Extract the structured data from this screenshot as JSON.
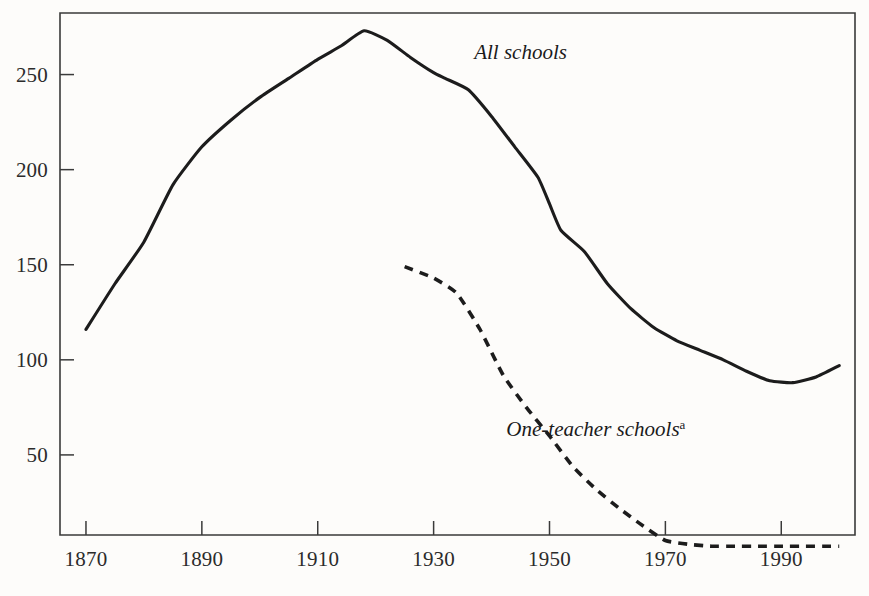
{
  "chart_data": {
    "type": "line",
    "title": "",
    "subtitle": "",
    "xlabel": "",
    "ylabel": "",
    "xlim": [
      1865,
      2001
    ],
    "ylim": [
      0,
      285
    ],
    "grid": false,
    "legend_position": "inline-annotation",
    "y_ticks": [
      50,
      100,
      150,
      200,
      250
    ],
    "y_tick_labels": [
      "50",
      "100",
      "150",
      "200",
      "250"
    ],
    "x_ticks": [
      1870,
      1890,
      1910,
      1930,
      1950,
      1970,
      1990
    ],
    "x_tick_labels": [
      "1870",
      "1890",
      "1910",
      "1930",
      "1950",
      "1970",
      "1990"
    ],
    "annotations": [
      {
        "text": "All schools",
        "footnote": "",
        "x": 1945,
        "y": 258
      },
      {
        "text": "One-teacher schools",
        "footnote": "a",
        "x": 1958,
        "y": 60
      }
    ],
    "series": [
      {
        "name": "All schools",
        "style": "solid",
        "footnote": "",
        "x": [
          1870,
          1875,
          1880,
          1885,
          1890,
          1895,
          1900,
          1905,
          1910,
          1914,
          1918,
          1922,
          1926,
          1930,
          1932,
          1936,
          1940,
          1944,
          1948,
          1950,
          1952,
          1956,
          1960,
          1964,
          1968,
          1972,
          1976,
          1980,
          1984,
          1988,
          1992,
          1996,
          2000
        ],
        "values": [
          116,
          140,
          162,
          192,
          212,
          226,
          238,
          248,
          258,
          265,
          273,
          268,
          259,
          251,
          248,
          242,
          228,
          212,
          196,
          182,
          168,
          157,
          140,
          127,
          117,
          110,
          105,
          100,
          94,
          89,
          88,
          91,
          97
        ]
      },
      {
        "name": "One-teacher schools",
        "style": "dashed",
        "footnote": "a",
        "x": [
          1925,
          1930,
          1934,
          1938,
          1942,
          1946,
          1950,
          1954,
          1958,
          1962,
          1966,
          1970,
          1974,
          1978,
          1982,
          1986,
          1990,
          1994,
          1998,
          2000
        ],
        "values": [
          149,
          143,
          135,
          116,
          92,
          75,
          60,
          44,
          32,
          22,
          13,
          5,
          3,
          2,
          2,
          2,
          2,
          2,
          2,
          2
        ]
      }
    ]
  },
  "axes": {
    "frame_color": "#3a3a3a",
    "line_color": "#1c1c1c",
    "background": "#fdfcfa"
  }
}
